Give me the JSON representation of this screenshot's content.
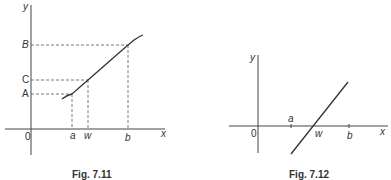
{
  "figures": [
    {
      "id": "fig-7-11",
      "caption": "Fig. 7.11",
      "axis_labels": {
        "x": "x",
        "y": "y",
        "origin": "0"
      },
      "x_ticks": [
        "a",
        "w",
        "b"
      ],
      "y_ticks": [
        "A",
        "C",
        "B"
      ],
      "labels": {
        "y_axis": "y",
        "x_axis": "x",
        "origin": "0",
        "tick_a": "a",
        "tick_w": "w",
        "tick_b": "b",
        "level_A": "A",
        "level_C": "C",
        "level_B": "B"
      },
      "description": "Increasing continuous curve; dashed projections map a→A, w→C, b→B"
    },
    {
      "id": "fig-7-12",
      "caption": "Fig. 7.12",
      "axis_labels": {
        "x": "x",
        "y": "y",
        "origin": "0"
      },
      "x_ticks": [
        "a",
        "w",
        "b"
      ],
      "labels": {
        "y_axis": "y",
        "x_axis": "x",
        "origin": "0",
        "tick_a": "a",
        "tick_w": "w",
        "tick_b": "b"
      },
      "description": "Straight line crossing x-axis at w, between a and b"
    }
  ],
  "colors": {
    "ink": "#333333",
    "background": "#ffffff"
  }
}
